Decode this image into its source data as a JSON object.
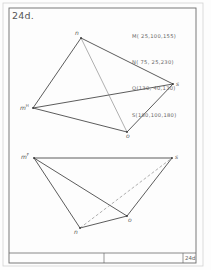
{
  "sheet": {
    "title": "24d.",
    "title_block_id": "24d"
  },
  "points": [
    {
      "name": "M",
      "text": "M( 25,100,155)"
    },
    {
      "name": "N",
      "text": "N( 75, 25,230)"
    },
    {
      "name": "O",
      "text": "O(130, 40,130)"
    },
    {
      "name": "S",
      "text": "S(180,100,180)"
    }
  ],
  "top_view": {
    "labels": {
      "n": "n",
      "m": "m",
      "m_sup": "H",
      "s": "s",
      "o": "o"
    },
    "vertices": {
      "n": [
        81,
        38
      ],
      "m": [
        33,
        108
      ],
      "s": [
        173,
        84
      ],
      "o": [
        127,
        132
      ]
    },
    "edges": [
      {
        "from": "n",
        "to": "s",
        "style": "solid"
      },
      {
        "from": "n",
        "to": "m",
        "style": "solid"
      },
      {
        "from": "m",
        "to": "s",
        "style": "solid"
      },
      {
        "from": "m",
        "to": "o",
        "style": "solid"
      },
      {
        "from": "o",
        "to": "s",
        "style": "solid"
      },
      {
        "from": "n",
        "to": "o",
        "style": "thin"
      }
    ]
  },
  "front_view": {
    "labels": {
      "m": "m",
      "m_sup": "F",
      "n": "n",
      "o": "o",
      "s": "s"
    },
    "vertices": {
      "m": [
        34,
        158
      ],
      "s": [
        172,
        158
      ],
      "n": [
        80,
        228
      ],
      "o": [
        127,
        216
      ]
    },
    "edges": [
      {
        "from": "m",
        "to": "s",
        "style": "solid"
      },
      {
        "from": "m",
        "to": "n",
        "style": "solid"
      },
      {
        "from": "m",
        "to": "o",
        "style": "solid"
      },
      {
        "from": "n",
        "to": "o",
        "style": "solid"
      },
      {
        "from": "o",
        "to": "s",
        "style": "solid"
      },
      {
        "from": "n",
        "to": "s",
        "style": "dashed"
      }
    ]
  },
  "colors": {
    "line": "#4a4a4a",
    "thin_line": "#7a7a7a",
    "frame": "#6a6a6a",
    "outer_frame": "#cfcfcf"
  }
}
